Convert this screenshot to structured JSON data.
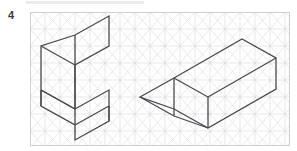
{
  "page": {
    "width": 297,
    "height": 151,
    "background": "#ffffff",
    "question_number": "4",
    "top_rule_color": "#ebebeb"
  },
  "grid": {
    "name": "isometric-triangular-grid",
    "line_color": "#d8d8d8",
    "border_color": "#cfcfcf",
    "line_width": 0.6,
    "origin_x": 30,
    "origin_y": 12,
    "width": 260,
    "height": 134,
    "column_spacing": 15,
    "row_spacing": 17,
    "columns": 17,
    "rows": 8
  },
  "drawings": {
    "line_color": "#4a4a50",
    "line_width": 1.3,
    "fill": "none",
    "objects": [
      {
        "name": "l-shaped-block",
        "label": "L-shaped isometric block",
        "paths": [
          "M 11 34 L 11 94 L 45 113 L 45 128 L 79 109 L 79 78 L 45 97 L 45 53 L 79 34 L 79 4 L 45 23 Z",
          "M 11 34 L 45 53",
          "M 45 53 L 45 97",
          "M 45 23 L 45 53",
          "M 45 97 L 11 78",
          "M 11 78 L 11 94",
          "M 11 78 L 45 97",
          "M 45 113 L 79 94",
          "M 79 94 L 79 109",
          "M 45 97 L 45 113"
        ]
      },
      {
        "name": "wedge-prism-block",
        "label": "Triangular wedge / prism isometric block",
        "paths": [
          "M 110 85 L 144 66 L 212 27 L 246 46 L 246 77 L 178 116 L 144 97 Z",
          "M 110 85 L 144 104",
          "M 144 104 L 178 116",
          "M 144 66 L 178 85",
          "M 178 85 L 246 46",
          "M 178 85 L 178 116",
          "M 144 66 L 144 104"
        ]
      }
    ]
  }
}
